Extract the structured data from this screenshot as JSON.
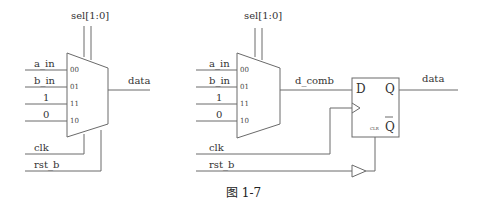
{
  "left_circuit": {
    "select_label": "sel[1:0]",
    "inputs": [
      {
        "signal": "a_in",
        "pin": "00"
      },
      {
        "signal": "b_in",
        "pin": "01"
      },
      {
        "signal": "1",
        "pin": "11"
      },
      {
        "signal": "0",
        "pin": "10"
      }
    ],
    "output_label": "data",
    "clock_label": "clk",
    "reset_label": "rst_b"
  },
  "right_circuit": {
    "select_label": "sel[1:0]",
    "inputs": [
      {
        "signal": "a_in",
        "pin": "00"
      },
      {
        "signal": "b_in",
        "pin": "01"
      },
      {
        "signal": "1",
        "pin": "11"
      },
      {
        "signal": "0",
        "pin": "10"
      }
    ],
    "mux_output_label": "d_comb",
    "flipflop": {
      "d_pin": "D",
      "q_pin": "Q",
      "qbar_pin": "Q",
      "clr_pin": "CLR"
    },
    "output_label": "data",
    "clock_label": "clk",
    "reset_label": "rst_b"
  },
  "caption": "图 1-7"
}
